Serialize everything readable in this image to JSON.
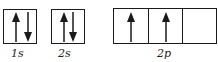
{
  "diagram": {
    "line_color": "#1a1a1a",
    "orbitals": [
      {
        "label": "1s",
        "subshell": "s",
        "boxes": [
          {
            "electrons": [
              "up",
              "down"
            ]
          }
        ]
      },
      {
        "label": "2s",
        "subshell": "s",
        "boxes": [
          {
            "electrons": [
              "up",
              "down"
            ]
          }
        ]
      },
      {
        "label": "2p",
        "subshell": "p",
        "boxes": [
          {
            "electrons": [
              "up"
            ]
          },
          {
            "electrons": [
              "up"
            ]
          },
          {
            "electrons": []
          }
        ]
      }
    ]
  }
}
